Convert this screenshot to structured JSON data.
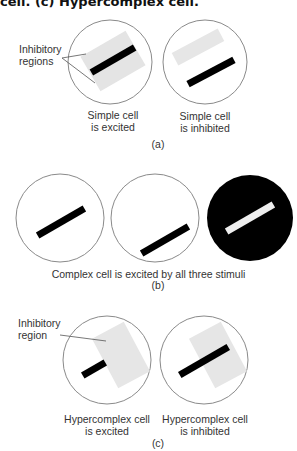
{
  "header": {
    "caption_fragment": "cell. (c) Hypercomplex cell."
  },
  "panel_a": {
    "tag": "(a)",
    "callout": [
      "Inhibitory",
      "regions"
    ],
    "captions": [
      [
        "Simple cell",
        "is excited"
      ],
      [
        "Simple cell",
        "is inhibited"
      ]
    ]
  },
  "panel_b": {
    "tag": "(b)",
    "caption": "Complex cell is excited by all three stimuli"
  },
  "panel_c": {
    "tag": "(c)",
    "callout": [
      "Inhibitory",
      "region"
    ],
    "captions": [
      [
        "Hypercomplex cell",
        "is excited"
      ],
      [
        "Hypercomplex cell",
        "is inhibited"
      ]
    ]
  },
  "colors": {
    "circle_stroke": "#8a8a8a",
    "inhibitory_region": "#e4e4e4",
    "bar": "#000000",
    "dark_field": "#000000",
    "light_bar": "#eeeeee"
  }
}
